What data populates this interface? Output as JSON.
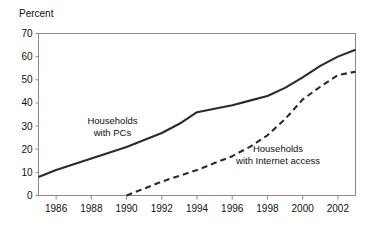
{
  "chart_data": {
    "type": "line",
    "title": "",
    "subtitle": "",
    "xlabel": "",
    "ylabel": "Percent",
    "xlim": [
      1985,
      2003
    ],
    "ylim": [
      0,
      70
    ],
    "grid": false,
    "legend_position": "inline-annotations",
    "y_ticks": [
      0,
      10,
      20,
      30,
      40,
      50,
      60,
      70
    ],
    "y_tick_labels": [
      "0",
      "10",
      "20",
      "30",
      "40",
      "50",
      "60",
      "70"
    ],
    "x_ticks": [
      1986,
      1988,
      1990,
      1992,
      1994,
      1996,
      1998,
      2000,
      2002
    ],
    "x_tick_labels": [
      "1986",
      "1988",
      "1990",
      "1992",
      "1994",
      "1996",
      "1998",
      "2000",
      "2002"
    ],
    "series": [
      {
        "name": "Households with PCs",
        "style": "solid",
        "color": "#2b2b2b",
        "x": [
          1985,
          1986,
          1987,
          1988,
          1989,
          1990,
          1991,
          1992,
          1993,
          1994,
          1995,
          1996,
          1997,
          1998,
          1999,
          2000,
          2001,
          2002,
          2003
        ],
        "values": [
          8,
          11,
          13.5,
          16,
          18.5,
          21,
          24,
          27,
          31,
          36,
          37.5,
          39,
          41,
          43,
          46.5,
          51,
          56,
          60,
          63
        ]
      },
      {
        "name": "Households with Internet access",
        "style": "dashed",
        "color": "#2b2b2b",
        "x": [
          1990,
          1991,
          1992,
          1993,
          1994,
          1995,
          1996,
          1997,
          1998,
          1999,
          2000,
          2001,
          2002,
          2003
        ],
        "values": [
          0,
          3,
          6,
          8.5,
          11,
          14,
          17,
          21,
          26,
          33,
          41.5,
          47,
          52,
          53.5
        ]
      }
    ],
    "annotations": [
      {
        "id": "pc-label",
        "lines": [
          "Households",
          "with PCs"
        ],
        "x": 1989.2,
        "y": 31
      },
      {
        "id": "internet-label",
        "lines": [
          "Households",
          "with Internet access"
        ],
        "x": 1998.6,
        "y": 19
      }
    ]
  },
  "frame": {
    "border_color": "#8a8a8a",
    "background": "#ffffff"
  }
}
